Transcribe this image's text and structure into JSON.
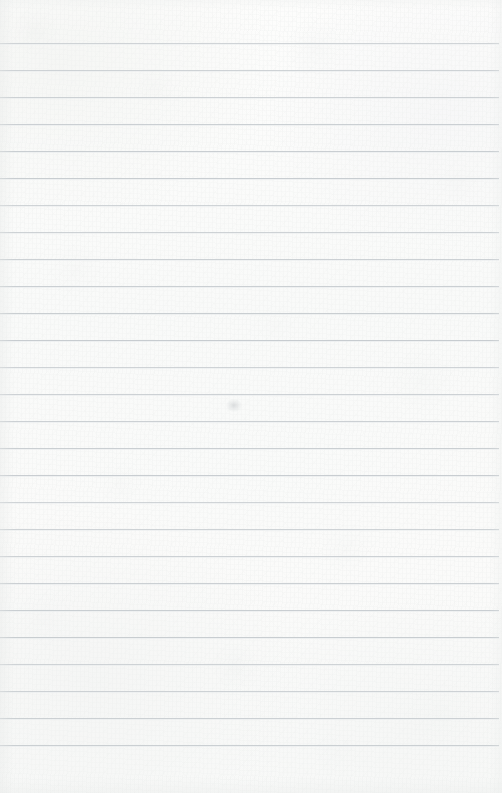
{
  "document": {
    "type": "lined-notebook-page",
    "title": "",
    "body_text": "",
    "is_blank": true,
    "page_number": "",
    "header_text": "",
    "footer_text": ""
  },
  "paper": {
    "background_color": "#fbfbfa",
    "rule_color": "#c6cbcf",
    "rule_halo_color": "#e9ecee",
    "width_px": 502,
    "height_px": 793
  },
  "ruling": {
    "line_count": 27,
    "spacing_px": 27,
    "first_line_y_px": 43,
    "last_line_y_px": 745,
    "left_inset_px": 0,
    "right_inset_px": 3,
    "lines_y": [
      43,
      70,
      97,
      124,
      151,
      178,
      205,
      232,
      259,
      286,
      313,
      340,
      367,
      394,
      421,
      448,
      475,
      502,
      529,
      556,
      583,
      610,
      637,
      664,
      691,
      718,
      745
    ],
    "rule_widths_px": [
      499,
      499,
      499,
      499,
      499,
      499,
      499,
      499,
      499,
      499,
      499,
      499,
      499,
      499,
      499,
      499,
      499,
      499,
      499,
      499,
      499,
      499,
      499,
      499,
      499,
      499,
      499
    ]
  },
  "marks": [
    {
      "name": "pencil-smudge",
      "x_px": 226,
      "y_px": 399,
      "width_px": 16,
      "height_px": 13,
      "color": "#b0b4b8"
    }
  ]
}
